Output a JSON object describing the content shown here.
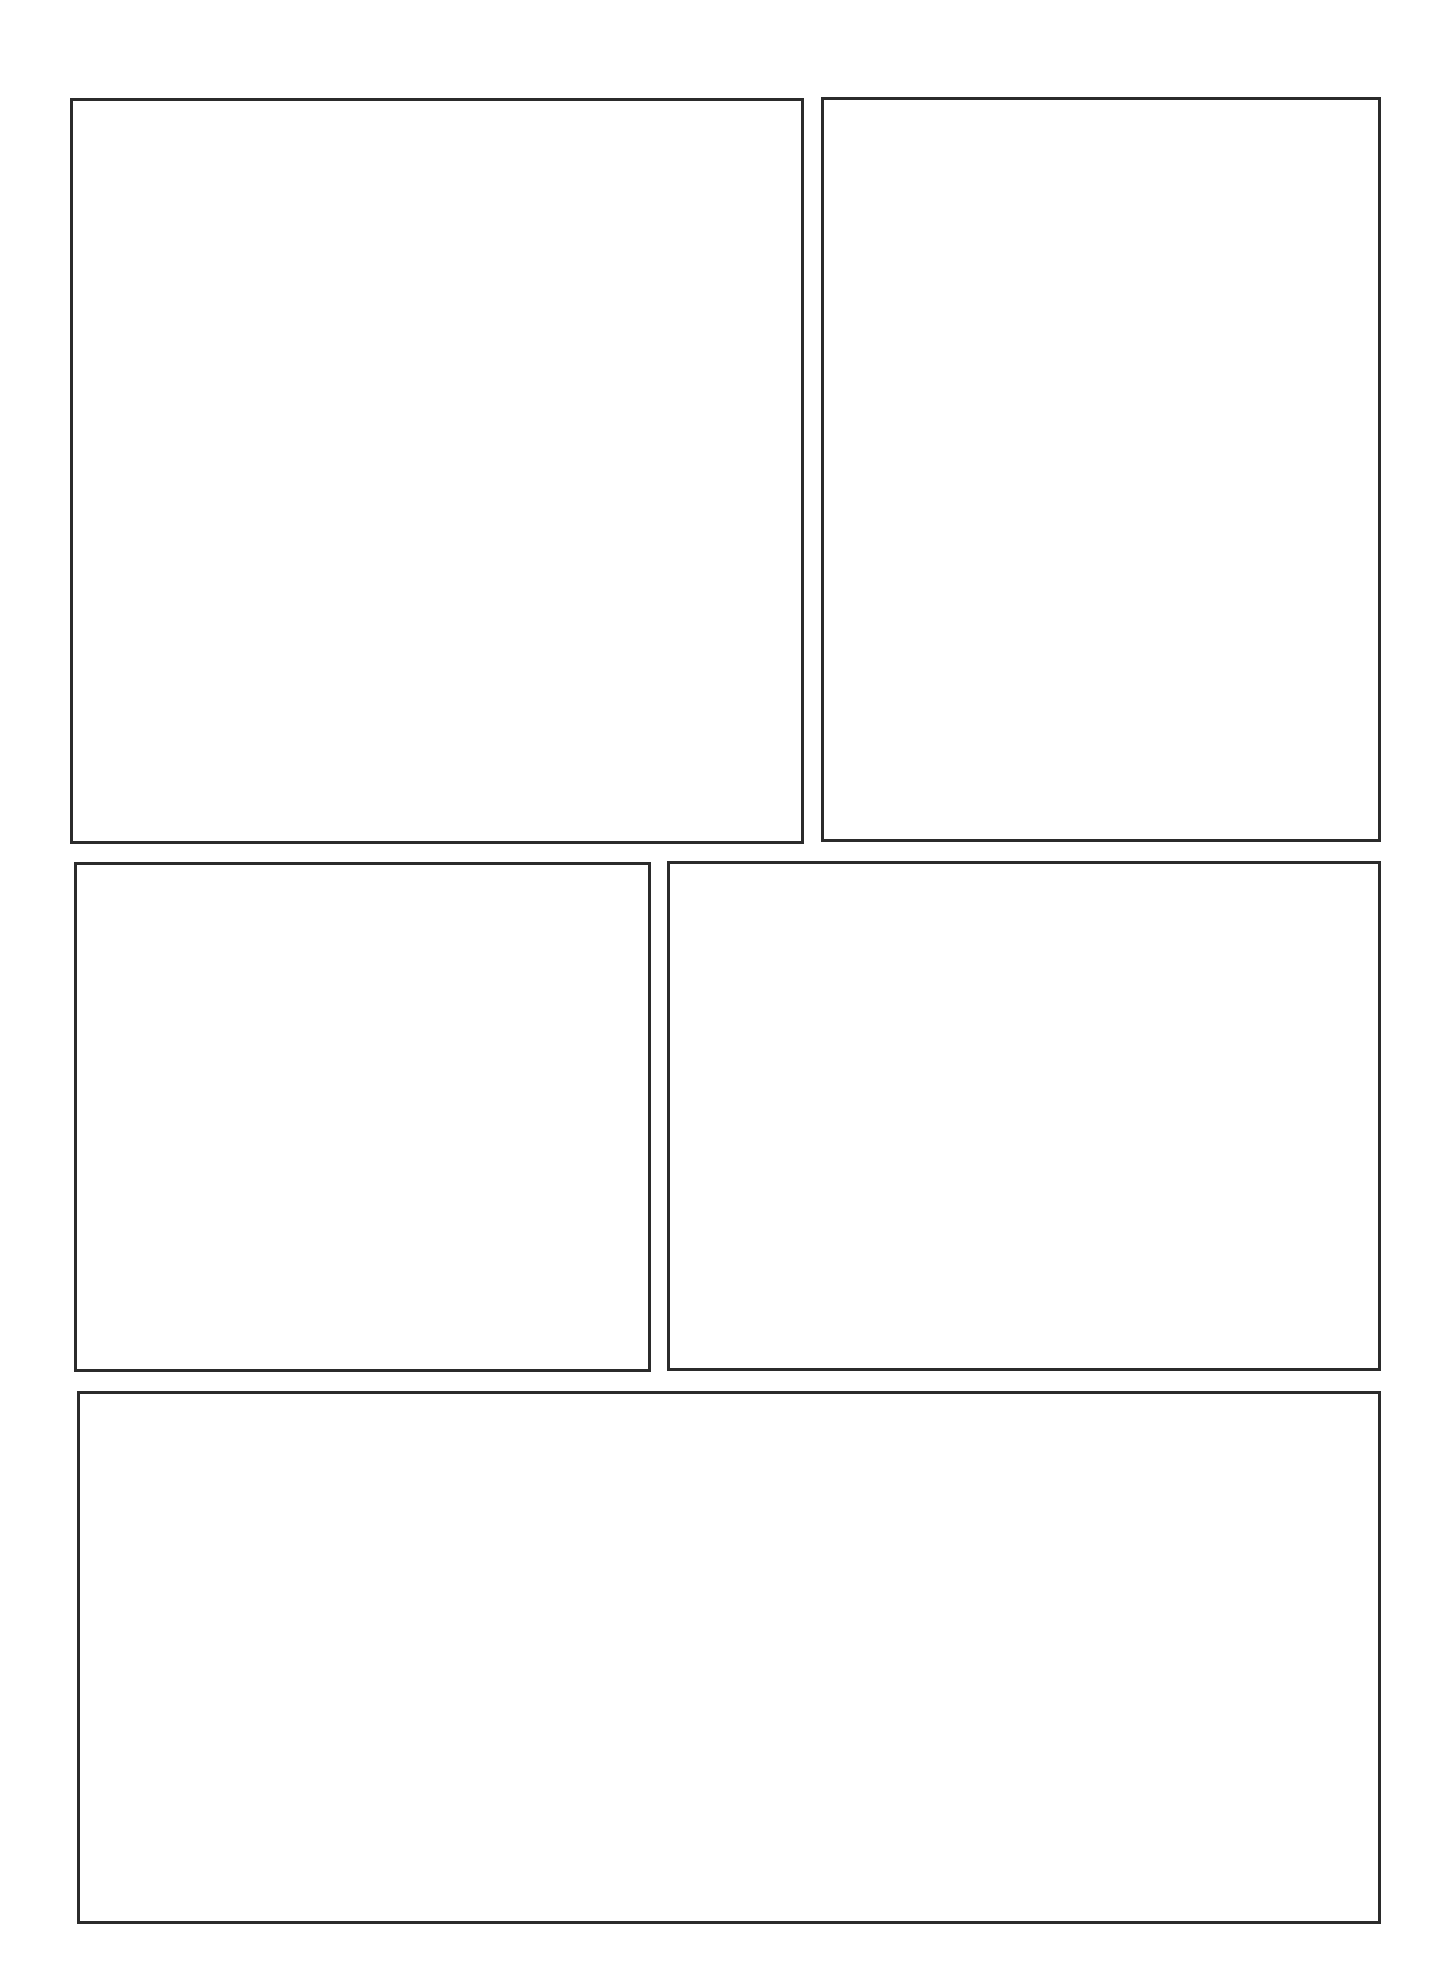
{
  "page": {
    "type": "comic-panel-template",
    "background_color": "#ffffff",
    "border_color": "#2b2b2b",
    "border_width_px": 3.5
  },
  "panels": [
    {
      "id": "panel-1",
      "row": 1,
      "position": "top-left",
      "left": 70,
      "top": 98,
      "width": 734,
      "height": 746,
      "content": ""
    },
    {
      "id": "panel-2",
      "row": 1,
      "position": "top-right",
      "left": 821,
      "top": 97,
      "width": 560,
      "height": 745,
      "content": ""
    },
    {
      "id": "panel-3",
      "row": 2,
      "position": "middle-left",
      "left": 74,
      "top": 862,
      "width": 577,
      "height": 510,
      "content": ""
    },
    {
      "id": "panel-4",
      "row": 2,
      "position": "middle-right",
      "left": 667,
      "top": 861,
      "width": 714,
      "height": 510,
      "content": ""
    },
    {
      "id": "panel-5",
      "row": 3,
      "position": "bottom-wide",
      "left": 77,
      "top": 1391,
      "width": 1304,
      "height": 533,
      "content": ""
    }
  ]
}
